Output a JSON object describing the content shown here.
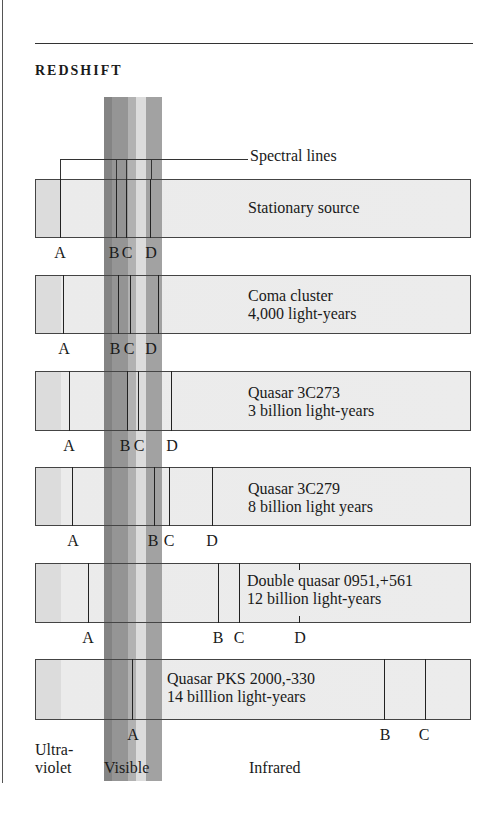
{
  "header": {
    "title": "REDSHIFT"
  },
  "callout": {
    "label": "Spectral lines"
  },
  "colors": {
    "visible_bands": [
      "#7a7a7a",
      "#8c8c8c",
      "#ababab",
      "#d9d9d9",
      "#9a9a9a"
    ],
    "bar_fill": "#ececec",
    "line": "#222222"
  },
  "rows": [
    {
      "name": "Stationary source",
      "line1": "Stationary source",
      "line2": "",
      "top": 179,
      "height": 59,
      "text_x": 248,
      "text_y": 199,
      "lines": {
        "A": 60,
        "B": 116,
        "C": 126,
        "D": 150
      },
      "labels": [
        {
          "t": "A",
          "x": 60
        },
        {
          "t": "B",
          "x": 114
        },
        {
          "t": "C",
          "x": 127
        },
        {
          "t": "D",
          "x": 151
        }
      ]
    },
    {
      "name": "Coma cluster",
      "line1": "Coma cluster",
      "line2": "4,000 light-years",
      "top": 275,
      "height": 59,
      "text_x": 248,
      "text_y": 287,
      "lines": {
        "A": 63,
        "B": 118,
        "C": 130,
        "D": 158
      },
      "labels": [
        {
          "t": "A",
          "x": 64
        },
        {
          "t": "B",
          "x": 115
        },
        {
          "t": "C",
          "x": 129
        },
        {
          "t": "D",
          "x": 151
        }
      ]
    },
    {
      "name": "Quasar 3C273",
      "line1": "Quasar 3C273",
      "line2": "3 billion light-years",
      "top": 371,
      "height": 60,
      "text_x": 248,
      "text_y": 384,
      "lines": {
        "A": 69,
        "B": 127,
        "C": 138,
        "D": 171
      },
      "labels": [
        {
          "t": "A",
          "x": 69
        },
        {
          "t": "B",
          "x": 125
        },
        {
          "t": "C",
          "x": 139
        },
        {
          "t": "D",
          "x": 172
        }
      ]
    },
    {
      "name": "Quasar 3C279",
      "line1": "Quasar 3C279",
      "line2": "8 billion light years",
      "top": 467,
      "height": 59,
      "text_x": 248,
      "text_y": 480,
      "lines": {
        "A": 72,
        "B": 154,
        "C": 169,
        "D": 212
      },
      "labels": [
        {
          "t": "A",
          "x": 73
        },
        {
          "t": "B",
          "x": 153
        },
        {
          "t": "C",
          "x": 169
        },
        {
          "t": "D",
          "x": 212
        }
      ]
    },
    {
      "name": "Double quasar 0951,+561",
      "line1": "Double quasar 0951,+561",
      "line2": "12 billion light-years",
      "top": 563,
      "height": 60,
      "text_x": 247,
      "text_y": 572,
      "lines": {
        "A": 88,
        "B": 218,
        "C": 239
      },
      "ticks": {
        "D": 299
      },
      "labels": [
        {
          "t": "A",
          "x": 88
        },
        {
          "t": "B",
          "x": 218
        },
        {
          "t": "C",
          "x": 239
        },
        {
          "t": "D",
          "x": 300
        }
      ]
    },
    {
      "name": "Quasar PKS 2000,-330",
      "line1": "Quasar PKS 2000,-330",
      "line2": "14 billlion light-years",
      "top": 659,
      "height": 61,
      "text_x": 167,
      "text_y": 670,
      "lines": {
        "A": 132,
        "B": 384,
        "C": 425
      },
      "labels": [
        {
          "t": "A",
          "x": 133
        },
        {
          "t": "B",
          "x": 385
        },
        {
          "t": "C",
          "x": 424
        }
      ]
    }
  ],
  "axis": {
    "ultraviolet_1": "Ultra-",
    "ultraviolet_2": "violet",
    "visible": "Visible",
    "infrared": "Infrared"
  },
  "chart_data": {
    "type": "diagram",
    "title": "REDSHIFT",
    "annotation": "Spectral lines",
    "x_regions": [
      "Ultraviolet",
      "Visible",
      "Infrared"
    ],
    "sources": [
      {
        "name": "Stationary source",
        "distance": "",
        "line_positions_px": {
          "A": 60,
          "B": 116,
          "C": 126,
          "D": 150
        }
      },
      {
        "name": "Coma cluster",
        "distance": "4,000 light-years",
        "line_positions_px": {
          "A": 63,
          "B": 118,
          "C": 130,
          "D": 158
        }
      },
      {
        "name": "Quasar 3C273",
        "distance": "3 billion light-years",
        "line_positions_px": {
          "A": 69,
          "B": 127,
          "C": 138,
          "D": 171
        }
      },
      {
        "name": "Quasar 3C279",
        "distance": "8 billion light years",
        "line_positions_px": {
          "A": 72,
          "B": 154,
          "C": 169,
          "D": 212
        }
      },
      {
        "name": "Double quasar 0951,+561",
        "distance": "12 billion light-years",
        "line_positions_px": {
          "A": 88,
          "B": 218,
          "C": 239,
          "D": 299
        }
      },
      {
        "name": "Quasar PKS 2000,-330",
        "distance": "14 billlion light-years",
        "line_positions_px": {
          "A": 132,
          "B": 384,
          "C": 425
        }
      }
    ]
  }
}
